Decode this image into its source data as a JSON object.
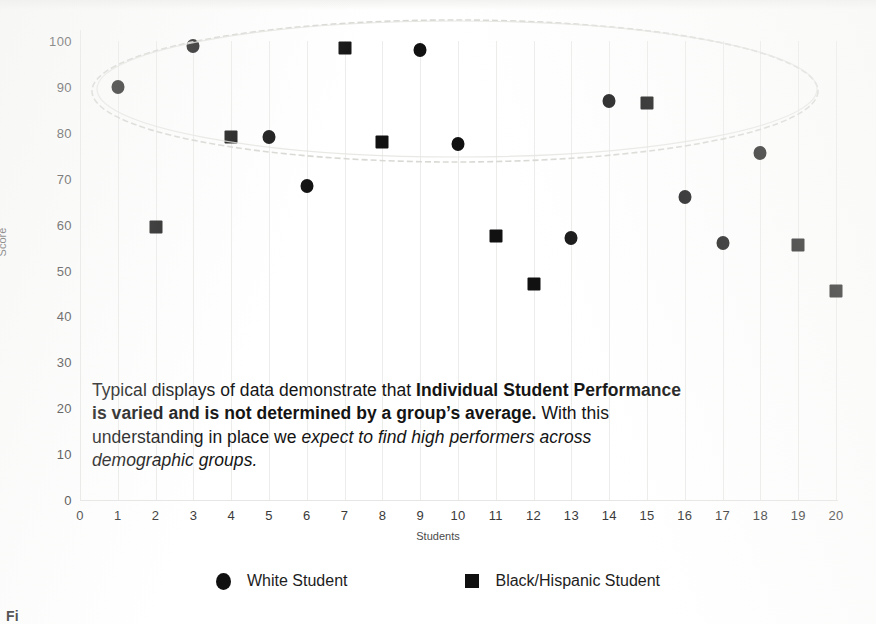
{
  "chart_data": {
    "type": "scatter",
    "title": "",
    "xlabel": "Students",
    "ylabel": "Score",
    "xlim": [
      0,
      20
    ],
    "ylim": [
      0,
      100
    ],
    "x_ticks": [
      0,
      1,
      2,
      3,
      4,
      5,
      6,
      7,
      8,
      9,
      10,
      11,
      12,
      13,
      14,
      15,
      16,
      17,
      18,
      19,
      20
    ],
    "y_ticks": [
      0,
      10,
      20,
      30,
      40,
      50,
      60,
      70,
      80,
      90,
      100
    ],
    "grid": "vertical",
    "legend_position": "bottom",
    "series": [
      {
        "name": "White Student",
        "marker": "circle",
        "color": "#111111",
        "points": [
          {
            "x": 1,
            "y": 90
          },
          {
            "x": 3,
            "y": 99
          },
          {
            "x": 5,
            "y": 79
          },
          {
            "x": 6,
            "y": 68.5
          },
          {
            "x": 9,
            "y": 98
          },
          {
            "x": 10,
            "y": 77.5
          },
          {
            "x": 13,
            "y": 57
          },
          {
            "x": 14,
            "y": 87
          },
          {
            "x": 16,
            "y": 66
          },
          {
            "x": 17,
            "y": 56
          },
          {
            "x": 18,
            "y": 75.5
          }
        ]
      },
      {
        "name": "Black/Hispanic Student",
        "marker": "square",
        "color": "#111111",
        "points": [
          {
            "x": 2,
            "y": 59.5
          },
          {
            "x": 4,
            "y": 79
          },
          {
            "x": 7,
            "y": 98.5
          },
          {
            "x": 8,
            "y": 78
          },
          {
            "x": 11,
            "y": 57.5
          },
          {
            "x": 12,
            "y": 47
          },
          {
            "x": 15,
            "y": 86.5
          },
          {
            "x": 19,
            "y": 55.5
          },
          {
            "x": 20,
            "y": 45.5
          }
        ]
      }
    ],
    "annotations": [
      {
        "type": "ellipse",
        "name": "high-performer-ellipse",
        "note": "hand-drawn faint ellipse encircling the high-scoring cluster"
      }
    ]
  },
  "axes": {
    "y_title": "Score",
    "x_title": "Students",
    "y_tick_labels": [
      "100",
      "90",
      "80",
      "70",
      "60",
      "50",
      "40",
      "30",
      "20",
      "10",
      "0"
    ],
    "x_tick_labels": [
      "0",
      "1",
      "2",
      "3",
      "4",
      "5",
      "6",
      "7",
      "8",
      "9",
      "10",
      "11",
      "12",
      "13",
      "14",
      "15",
      "16",
      "17",
      "18",
      "19",
      "20"
    ]
  },
  "legend": {
    "items": [
      {
        "label": "White Student",
        "marker": "circle"
      },
      {
        "label": "Black/Hispanic Student",
        "marker": "square"
      }
    ]
  },
  "callout": {
    "segment_1": "Typical displays of data demonstrate that ",
    "segment_2_bold": "Individual Student Performance is varied and is not determined by a group’s average.",
    "segment_3": " With this understanding in place we ",
    "segment_4_italic": "expect to find high performers across demographic groups."
  },
  "caption": {
    "text": "Fi"
  },
  "colors": {
    "marker": "#111111",
    "grid": "#ececea",
    "text": "#1a1a1a",
    "background": "#ffffff"
  }
}
